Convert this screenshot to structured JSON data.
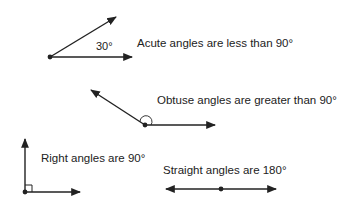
{
  "colors": {
    "ink": "#222222",
    "background": "#ffffff"
  },
  "angles": {
    "acute": {
      "label": "Acute angles are less than 90°",
      "measure": "30°"
    },
    "obtuse": {
      "label": "Obtuse angles are greater than 90°"
    },
    "right": {
      "label": "Right angles are 90°"
    },
    "straight": {
      "label": "Straight angles are 180°"
    }
  }
}
